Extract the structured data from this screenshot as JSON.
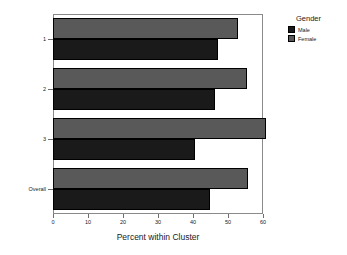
{
  "chart_data": {
    "type": "bar",
    "orientation": "horizontal",
    "title": "",
    "xlabel": "Percent within Cluster",
    "ylabel": "Cluster",
    "xlim": [
      0,
      60
    ],
    "xticks": [
      0,
      10,
      20,
      30,
      40,
      50,
      60
    ],
    "xtick_labels": [
      "0",
      "10",
      "20",
      "30",
      "40",
      "50",
      "60"
    ],
    "grid": false,
    "categories": [
      "1",
      "2",
      "3",
      "Overall"
    ],
    "series": [
      {
        "name": "Male",
        "color": "#1a1a1a",
        "values": [
          47.2,
          46.4,
          40.6,
          44.8
        ]
      },
      {
        "name": "Female",
        "color": "#595959",
        "values": [
          52.8,
          55.3,
          60.8,
          55.8
        ]
      }
    ],
    "legend": {
      "title": "Gender",
      "position": "top-right",
      "entries": [
        {
          "label": "Male",
          "color": "#1a1a1a"
        },
        {
          "label": "Female",
          "color": "#595959"
        }
      ]
    }
  },
  "axes": {
    "x_title": "Percent within Cluster",
    "y_title": "Cluster",
    "x_tick_labels": [
      "0",
      "10",
      "20",
      "30",
      "40",
      "50",
      "60"
    ],
    "y_tick_labels": [
      "1",
      "2",
      "3",
      "Overall"
    ]
  },
  "legend": {
    "title": "Gender",
    "items": [
      {
        "label": "Male"
      },
      {
        "label": "Female"
      }
    ]
  }
}
